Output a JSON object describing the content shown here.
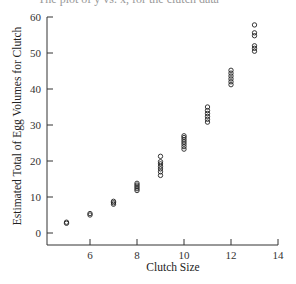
{
  "caption_clipped": "The plot of ŷ vs. x, for the clutch data",
  "chart_data": {
    "type": "scatter",
    "title": "",
    "xlabel": "Clutch Size",
    "ylabel": "Estimated Total of Egg Volumes for Clutch",
    "xlim": [
      4.15,
      14
    ],
    "ylim": [
      -3.3,
      60
    ],
    "x_ticks": [
      6,
      8,
      10,
      12,
      14
    ],
    "y_ticks": [
      0,
      10,
      20,
      30,
      40,
      50,
      60
    ],
    "grid": false,
    "legend": null,
    "marker": "open-circle",
    "points": [
      {
        "x": 5,
        "y": 3.0
      },
      {
        "x": 5,
        "y": 2.7
      },
      {
        "x": 6,
        "y": 5.0
      },
      {
        "x": 6,
        "y": 5.4
      },
      {
        "x": 7,
        "y": 8.0
      },
      {
        "x": 7,
        "y": 8.4
      },
      {
        "x": 7,
        "y": 8.8
      },
      {
        "x": 8,
        "y": 11.8
      },
      {
        "x": 8,
        "y": 12.3
      },
      {
        "x": 8,
        "y": 12.8
      },
      {
        "x": 8,
        "y": 13.3
      },
      {
        "x": 8,
        "y": 13.8
      },
      {
        "x": 9,
        "y": 16.0
      },
      {
        "x": 9,
        "y": 17.0
      },
      {
        "x": 9,
        "y": 17.8
      },
      {
        "x": 9,
        "y": 18.5
      },
      {
        "x": 9,
        "y": 19.2
      },
      {
        "x": 9,
        "y": 19.8
      },
      {
        "x": 9,
        "y": 21.3
      },
      {
        "x": 10,
        "y": 23.3
      },
      {
        "x": 10,
        "y": 24.0
      },
      {
        "x": 10,
        "y": 24.7
      },
      {
        "x": 10,
        "y": 25.3
      },
      {
        "x": 10,
        "y": 25.9
      },
      {
        "x": 10,
        "y": 26.5
      },
      {
        "x": 10,
        "y": 27.0
      },
      {
        "x": 11,
        "y": 30.8
      },
      {
        "x": 11,
        "y": 31.6
      },
      {
        "x": 11,
        "y": 32.4
      },
      {
        "x": 11,
        "y": 33.2
      },
      {
        "x": 11,
        "y": 34.0
      },
      {
        "x": 11,
        "y": 35.0
      },
      {
        "x": 12,
        "y": 41.2
      },
      {
        "x": 12,
        "y": 42.0
      },
      {
        "x": 12,
        "y": 42.8
      },
      {
        "x": 12,
        "y": 43.6
      },
      {
        "x": 12,
        "y": 44.4
      },
      {
        "x": 12,
        "y": 45.2
      },
      {
        "x": 13,
        "y": 50.5
      },
      {
        "x": 13,
        "y": 51.3
      },
      {
        "x": 13,
        "y": 52.0
      },
      {
        "x": 13,
        "y": 54.8
      },
      {
        "x": 13,
        "y": 55.6
      },
      {
        "x": 13,
        "y": 57.8
      }
    ]
  }
}
